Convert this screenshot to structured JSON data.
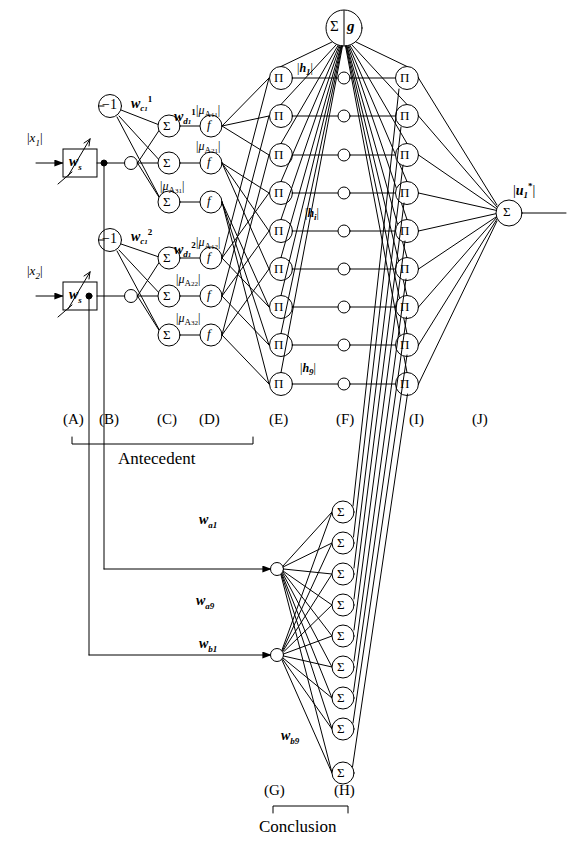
{
  "figure": {
    "kind": "neuro-fuzzy-network-diagram",
    "sections": {
      "antecedent": "Antecedent",
      "conclusion": "Conclusion"
    },
    "column_labels": [
      "(A)",
      "(B)",
      "(C)",
      "(D)",
      "(E)",
      "(F)",
      "(I)",
      "(J)",
      "(G)",
      "(H)"
    ]
  },
  "inputs": [
    {
      "signal": "x",
      "signal_sub": "1",
      "gain_label": "w",
      "gain_sub": "s"
    },
    {
      "signal": "x",
      "signal_sub": "2",
      "gain_label": "w",
      "gain_sub": "s"
    }
  ],
  "bias": {
    "label": "−1",
    "count": 2
  },
  "weights": {
    "c1": {
      "base": "w",
      "sub": "c",
      "subsub": "1",
      "sup": "1"
    },
    "d1": {
      "base": "w",
      "sub": "d",
      "subsub": "1",
      "sup": "1"
    },
    "c2": {
      "base": "w",
      "sub": "c",
      "subsub": "1",
      "sup": "2"
    },
    "d2": {
      "base": "w",
      "sub": "d",
      "subsub": "1",
      "sup": "2"
    },
    "a1": {
      "base": "w",
      "sub": "a1"
    },
    "a9": {
      "base": "w",
      "sub": "a9"
    },
    "b1": {
      "base": "w",
      "sub": "b1"
    },
    "b9": {
      "base": "w",
      "sub": "b9"
    }
  },
  "membership": [
    {
      "sym": "μ",
      "set": "A",
      "sub": "11"
    },
    {
      "sym": "μ",
      "set": "A",
      "sub": "21"
    },
    {
      "sym": "μ",
      "set": "A",
      "sub": "31"
    },
    {
      "sym": "μ",
      "set": "A",
      "sub": "12"
    },
    {
      "sym": "μ",
      "set": "A",
      "sub": "22"
    },
    {
      "sym": "μ",
      "set": "A",
      "sub": "32"
    }
  ],
  "nodes": {
    "sum_glyph": "Σ",
    "prod_glyph": "Π",
    "f_glyph": "f",
    "norm_node": {
      "sum": "Σ",
      "g": "g"
    }
  },
  "firing_strengths": [
    {
      "sym": "h",
      "sub": "1"
    },
    {
      "sym": "h",
      "sub": "i"
    },
    {
      "sym": "h",
      "sub": "9"
    }
  ],
  "output": {
    "sym": "u",
    "sub": "1",
    "sup": "*"
  },
  "counts": {
    "rules": 9,
    "membership_per_input": 3,
    "inputs": 2,
    "conclusion_nodes": 9
  },
  "colors": {
    "stroke": "#000000",
    "fill": "#ffffff",
    "background": "#ffffff"
  }
}
